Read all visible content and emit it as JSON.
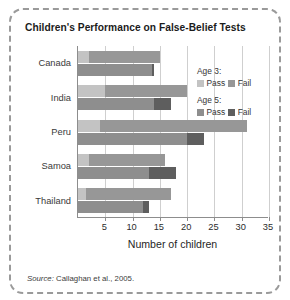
{
  "chart_data": {
    "type": "bar",
    "orientation": "horizontal",
    "title": "Children's Performance on False-Belief Tests",
    "xlabel": "Number of children",
    "ylabel": "",
    "xlim": [
      0,
      35
    ],
    "xticks": [
      5,
      10,
      15,
      20,
      25,
      30,
      35
    ],
    "xtick_labels": [
      "5",
      "10",
      "15",
      "20",
      "25",
      "30",
      "35"
    ],
    "grid": true,
    "grid_axis": "x",
    "legend_position": "inside-upper-right",
    "categories": [
      "Canada",
      "India",
      "Peru",
      "Samoa",
      "Thailand"
    ],
    "series": [
      {
        "name": "Age 3: Pass",
        "group": "Age 3",
        "stack": "age3",
        "color": "#c3c3c3",
        "values": [
          2,
          5,
          4,
          2,
          1.5
        ]
      },
      {
        "name": "Age 3: Fail",
        "group": "Age 3",
        "stack": "age3",
        "color": "#979797",
        "values": [
          13,
          15,
          27,
          14,
          15.5
        ]
      },
      {
        "name": "Age 5: Pass",
        "group": "Age 5",
        "stack": "age5",
        "color": "#8e8e8e",
        "values": [
          13.5,
          14,
          20,
          13,
          12
        ]
      },
      {
        "name": "Age 5: Fail",
        "group": "Age 5",
        "stack": "age5",
        "color": "#5e5e5e",
        "values": [
          0.5,
          3,
          3,
          5,
          1
        ]
      }
    ],
    "totals": {
      "age3": [
        15,
        20,
        31,
        16,
        17
      ],
      "age5": [
        14,
        17,
        23,
        18,
        13
      ]
    }
  },
  "legend": {
    "blocks": [
      {
        "heading": "Age 3:",
        "items": [
          {
            "label": "Pass",
            "color": "#c3c3c3"
          },
          {
            "label": "Fail",
            "color": "#979797"
          }
        ]
      },
      {
        "heading": "Age 5:",
        "items": [
          {
            "label": "Pass",
            "color": "#8e8e8e"
          },
          {
            "label": "Fail",
            "color": "#5e5e5e"
          }
        ]
      }
    ]
  },
  "source": {
    "prefix": "Source:",
    "text": " Callaghan et al., 2005."
  }
}
